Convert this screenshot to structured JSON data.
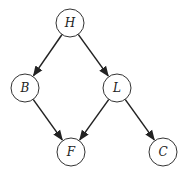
{
  "diagram": {
    "type": "directed-graph",
    "nodes": [
      {
        "id": "H",
        "label": "H",
        "x": 70,
        "y": 23
      },
      {
        "id": "B",
        "label": "B",
        "x": 25,
        "y": 88
      },
      {
        "id": "L",
        "label": "L",
        "x": 117,
        "y": 88
      },
      {
        "id": "F",
        "label": "F",
        "x": 71,
        "y": 152
      },
      {
        "id": "C",
        "label": "C",
        "x": 163,
        "y": 152
      }
    ],
    "edges": [
      {
        "from": "H",
        "to": "B"
      },
      {
        "from": "H",
        "to": "L"
      },
      {
        "from": "B",
        "to": "F"
      },
      {
        "from": "L",
        "to": "F"
      },
      {
        "from": "L",
        "to": "C"
      }
    ],
    "colors": {
      "stroke": "#222222",
      "fill": "#ffffff"
    }
  }
}
